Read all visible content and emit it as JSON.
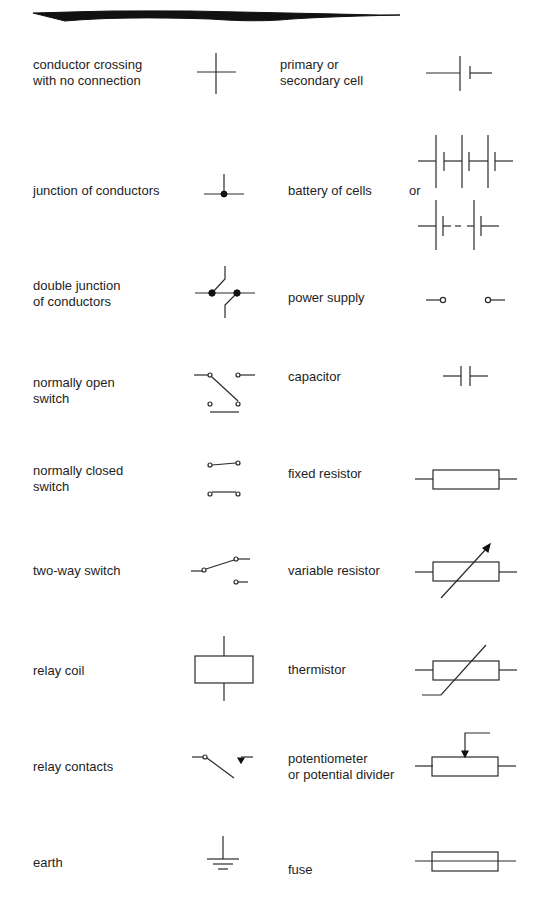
{
  "left_column": [
    {
      "id": "conductor-crossing",
      "label": "conductor crossing\nwith no connection"
    },
    {
      "id": "junction",
      "label": "junction of conductors"
    },
    {
      "id": "double-junction",
      "label": "double junction\nof conductors"
    },
    {
      "id": "normally-open-switch",
      "label": "normally open\nswitch"
    },
    {
      "id": "normally-closed-switch",
      "label": "normally closed\nswitch"
    },
    {
      "id": "two-way-switch",
      "label": "two-way switch"
    },
    {
      "id": "relay-coil",
      "label": "relay coil"
    },
    {
      "id": "relay-contacts",
      "label": "relay contacts"
    },
    {
      "id": "earth",
      "label": "earth"
    }
  ],
  "right_column": [
    {
      "id": "cell",
      "label": "primary or\nsecondary cell"
    },
    {
      "id": "battery",
      "label": "battery of cells",
      "or_label": "or"
    },
    {
      "id": "power-supply",
      "label": "power supply"
    },
    {
      "id": "capacitor",
      "label": "capacitor"
    },
    {
      "id": "fixed-resistor",
      "label": "fixed resistor"
    },
    {
      "id": "variable-resistor",
      "label": "variable resistor"
    },
    {
      "id": "thermistor",
      "label": "thermistor"
    },
    {
      "id": "potentiometer",
      "label": "potentiometer\nor potential divider"
    },
    {
      "id": "fuse",
      "label": "fuse"
    }
  ]
}
